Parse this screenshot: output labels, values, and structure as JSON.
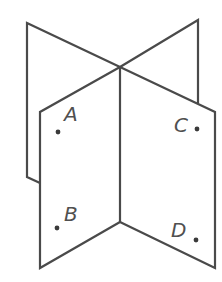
{
  "diagram": {
    "stroke_color": "#4a4a4a",
    "points": [
      {
        "label": "A",
        "x": 58,
        "y": 132,
        "label_x": 64,
        "label_y": 104
      },
      {
        "label": "B",
        "x": 57,
        "y": 228,
        "label_x": 64,
        "label_y": 204
      },
      {
        "label": "C",
        "x": 197,
        "y": 129,
        "label_x": 174,
        "label_y": 115
      },
      {
        "label": "D",
        "x": 196,
        "y": 240,
        "label_x": 171,
        "label_y": 220
      }
    ]
  }
}
